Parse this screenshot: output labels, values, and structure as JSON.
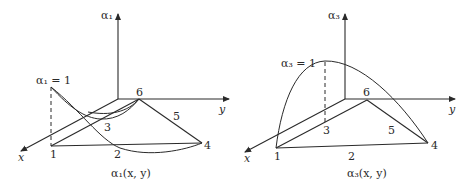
{
  "left_panel": {
    "axis_label": "α₁",
    "peak_label": "α₁ = 1",
    "x_axis_label": "x",
    "y_axis_label": "y",
    "caption": "α₁(x, y)",
    "nodes": [
      "1",
      "2",
      "3",
      "4",
      "5",
      "6"
    ]
  },
  "right_panel": {
    "axis_label": "α₃",
    "peak_label": "α₃ = 1",
    "x_axis_label": "x",
    "y_axis_label": "y",
    "caption": "α₃(x, y)",
    "nodes": [
      "1",
      "2",
      "3",
      "4",
      "5",
      "6"
    ]
  },
  "colors": {
    "stroke": "#2a2a2a",
    "background": "#ffffff"
  }
}
